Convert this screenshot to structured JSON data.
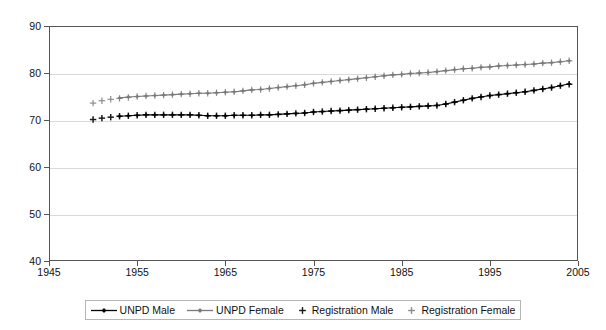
{
  "chart_data": {
    "type": "line",
    "title": "",
    "subtitle": "",
    "xlabel": "",
    "ylabel": "",
    "xlim": [
      1945,
      2005
    ],
    "ylim": [
      40,
      90
    ],
    "xticks": [
      1945,
      1955,
      1965,
      1975,
      1985,
      1995,
      2005
    ],
    "yticks": [
      40,
      50,
      60,
      70,
      80,
      90
    ],
    "grid": true,
    "legend_position": "bottom",
    "legend_entries": [
      {
        "label": "UNPD Male",
        "marker": "diamond",
        "line": true,
        "color": "#000000"
      },
      {
        "label": "UNPD Female",
        "marker": "diamond",
        "line": true,
        "color": "#7a7a7a"
      },
      {
        "label": "Registration Male",
        "marker": "plus",
        "line": false,
        "color": "#1a1a1a"
      },
      {
        "label": "Registration Female",
        "marker": "plus",
        "line": false,
        "color": "#8c8c8c"
      }
    ],
    "series": [
      {
        "name": "Registration Male",
        "marker": "plus",
        "line": false,
        "color": "#1a1a1a",
        "x": [
          1950,
          1951,
          1952,
          1953,
          1954,
          1955,
          1956,
          1957,
          1958,
          1959,
          1960,
          1961,
          1962,
          1963,
          1964,
          1965,
          1966,
          1967,
          1968,
          1969,
          1970,
          1971,
          1972,
          1973,
          1974,
          1975,
          1976,
          1977,
          1978,
          1979,
          1980,
          1981,
          1982,
          1983,
          1984,
          1985,
          1986,
          1987,
          1988,
          1989,
          1990,
          1991,
          1992,
          1993,
          1994,
          1995,
          1996,
          1997,
          1998,
          1999,
          2000,
          2001,
          2002,
          2003,
          2004
        ],
        "y": [
          70.1,
          70.4,
          70.6,
          70.8,
          70.9,
          71.0,
          71.1,
          71.1,
          71.1,
          71.1,
          71.1,
          71.1,
          71.0,
          70.9,
          70.9,
          70.9,
          71.0,
          71.0,
          71.0,
          71.1,
          71.1,
          71.2,
          71.3,
          71.4,
          71.5,
          71.7,
          71.8,
          71.9,
          72.0,
          72.1,
          72.2,
          72.3,
          72.4,
          72.5,
          72.6,
          72.7,
          72.8,
          72.9,
          73.0,
          73.1,
          73.4,
          73.8,
          74.2,
          74.6,
          74.9,
          75.2,
          75.4,
          75.6,
          75.8,
          76.0,
          76.3,
          76.6,
          76.9,
          77.3,
          77.6
        ]
      },
      {
        "name": "Registration Female",
        "marker": "plus",
        "line": false,
        "color": "#8c8c8c",
        "x": [
          1950,
          1951,
          1952,
          1953,
          1954,
          1955,
          1956,
          1957,
          1958,
          1959,
          1960,
          1961,
          1962,
          1963,
          1964,
          1965,
          1966,
          1967,
          1968,
          1969,
          1970,
          1971,
          1972,
          1973,
          1974,
          1975,
          1976,
          1977,
          1978,
          1979,
          1980,
          1981,
          1982,
          1983,
          1984,
          1985,
          1986,
          1987,
          1988,
          1989,
          1990,
          1991,
          1992,
          1993,
          1994,
          1995,
          1996,
          1997,
          1998,
          1999,
          2000,
          2001,
          2002,
          2003,
          2004
        ],
        "y": [
          73.6,
          74.1,
          74.4,
          74.6,
          74.8,
          75.0,
          75.1,
          75.2,
          75.3,
          75.4,
          75.5,
          75.6,
          75.7,
          75.7,
          75.8,
          75.9,
          76.0,
          76.2,
          76.4,
          76.5,
          76.7,
          76.9,
          77.1,
          77.3,
          77.5,
          77.8,
          78.0,
          78.2,
          78.4,
          78.6,
          78.8,
          79.0,
          79.2,
          79.4,
          79.6,
          79.7,
          79.9,
          80.0,
          80.1,
          80.3,
          80.5,
          80.7,
          80.9,
          81.0,
          81.2,
          81.3,
          81.5,
          81.6,
          81.7,
          81.8,
          81.9,
          82.1,
          82.2,
          82.4,
          82.6
        ]
      },
      {
        "name": "UNPD Male",
        "marker": "diamond",
        "line": true,
        "color": "#000000",
        "x": [
          1953,
          1954,
          1955,
          1956,
          1957,
          1958,
          1959,
          1960,
          1961,
          1962,
          1963,
          1964,
          1965,
          1966,
          1967,
          1968,
          1969,
          1970,
          1971,
          1972,
          1973,
          1974,
          1975,
          1976,
          1977,
          1978,
          1979,
          1980,
          1981,
          1982,
          1983,
          1984,
          1985,
          1986,
          1987,
          1988,
          1989,
          1990,
          1991,
          1992,
          1993,
          1994,
          1995,
          1996,
          1997,
          1998,
          1999,
          2000,
          2001,
          2002,
          2003,
          2004
        ],
        "y": [
          70.8,
          70.9,
          71.0,
          71.1,
          71.1,
          71.1,
          71.1,
          71.1,
          71.1,
          71.0,
          70.9,
          70.9,
          70.9,
          71.0,
          71.0,
          71.0,
          71.1,
          71.1,
          71.2,
          71.3,
          71.4,
          71.5,
          71.7,
          71.8,
          71.9,
          72.0,
          72.1,
          72.2,
          72.3,
          72.4,
          72.5,
          72.6,
          72.7,
          72.8,
          72.9,
          73.0,
          73.1,
          73.4,
          73.8,
          74.2,
          74.6,
          74.9,
          75.2,
          75.4,
          75.6,
          75.8,
          76.0,
          76.3,
          76.6,
          76.9,
          77.3,
          77.7
        ]
      },
      {
        "name": "UNPD Female",
        "marker": "diamond",
        "line": true,
        "color": "#7a7a7a",
        "x": [
          1953,
          1954,
          1955,
          1956,
          1957,
          1958,
          1959,
          1960,
          1961,
          1962,
          1963,
          1964,
          1965,
          1966,
          1967,
          1968,
          1969,
          1970,
          1971,
          1972,
          1973,
          1974,
          1975,
          1976,
          1977,
          1978,
          1979,
          1980,
          1981,
          1982,
          1983,
          1984,
          1985,
          1986,
          1987,
          1988,
          1989,
          1990,
          1991,
          1992,
          1993,
          1994,
          1995,
          1996,
          1997,
          1998,
          1999,
          2000,
          2001,
          2002,
          2003,
          2004
        ],
        "y": [
          74.7,
          74.9,
          75.0,
          75.1,
          75.2,
          75.3,
          75.4,
          75.5,
          75.6,
          75.7,
          75.7,
          75.8,
          75.9,
          76.0,
          76.2,
          76.4,
          76.5,
          76.7,
          76.9,
          77.1,
          77.3,
          77.5,
          77.8,
          78.0,
          78.2,
          78.4,
          78.6,
          78.8,
          79.0,
          79.2,
          79.4,
          79.6,
          79.7,
          79.9,
          80.0,
          80.1,
          80.3,
          80.5,
          80.7,
          80.9,
          81.0,
          81.2,
          81.3,
          81.5,
          81.6,
          81.7,
          81.8,
          81.9,
          82.1,
          82.2,
          82.4,
          82.6
        ]
      }
    ]
  }
}
